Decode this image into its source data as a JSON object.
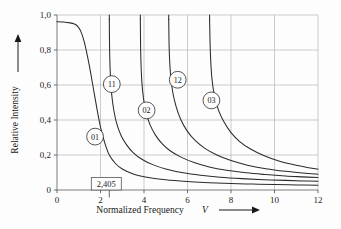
{
  "chart_data": {
    "type": "line",
    "title": "",
    "xlabel": "Normalized Frequency",
    "xlabel_symbol": "V",
    "ylabel": "Relative Intensity",
    "xlim": [
      0,
      12
    ],
    "ylim": [
      0,
      1.0
    ],
    "grid": true,
    "legend": "inline-bubbles",
    "x_ticks": [
      "0",
      "2",
      "4",
      "6",
      "8",
      "10",
      "12"
    ],
    "x_tick_values": [
      0,
      2,
      4,
      6,
      8,
      10,
      12
    ],
    "y_ticks": [
      "0",
      "0,2",
      "0,4",
      "0,6",
      "0,8",
      "1,0"
    ],
    "y_tick_values": [
      0,
      0.2,
      0.4,
      0.6,
      0.8,
      1.0
    ],
    "annotations": [
      {
        "name": "cutoff-2405",
        "text": "2,405",
        "x": 2.405,
        "y": 0.1
      }
    ],
    "series": [
      {
        "name": "01",
        "label": "01",
        "cutoff": 0.0,
        "label_point": {
          "x": 1.75,
          "y": 0.305
        },
        "points": [
          [
            0.0,
            0.962
          ],
          [
            0.3,
            0.96
          ],
          [
            0.6,
            0.955
          ],
          [
            0.8,
            0.948
          ],
          [
            0.95,
            0.935
          ],
          [
            1.1,
            0.905
          ],
          [
            1.25,
            0.848
          ],
          [
            1.4,
            0.765
          ],
          [
            1.55,
            0.668
          ],
          [
            1.7,
            0.56
          ],
          [
            1.85,
            0.455
          ],
          [
            2.0,
            0.36
          ],
          [
            2.2,
            0.268
          ],
          [
            2.405,
            0.2
          ],
          [
            2.7,
            0.15
          ],
          [
            3.0,
            0.12
          ],
          [
            3.5,
            0.092
          ],
          [
            4.0,
            0.076
          ],
          [
            5.0,
            0.058
          ],
          [
            6.0,
            0.048
          ],
          [
            7.0,
            0.042
          ],
          [
            8.0,
            0.037
          ],
          [
            9.0,
            0.034
          ],
          [
            10.0,
            0.031
          ],
          [
            11.0,
            0.029
          ],
          [
            12.0,
            0.027
          ]
        ]
      },
      {
        "name": "11",
        "label": "11",
        "cutoff": 2.405,
        "label_point": {
          "x": 2.52,
          "y": 0.605
        },
        "points": [
          [
            2.405,
            0.975
          ],
          [
            2.42,
            0.79
          ],
          [
            2.46,
            0.64
          ],
          [
            2.52,
            0.54
          ],
          [
            2.62,
            0.45
          ],
          [
            2.75,
            0.378
          ],
          [
            2.95,
            0.31
          ],
          [
            3.2,
            0.258
          ],
          [
            3.5,
            0.214
          ],
          [
            3.9,
            0.176
          ],
          [
            4.4,
            0.145
          ],
          [
            5.0,
            0.12
          ],
          [
            5.8,
            0.098
          ],
          [
            6.6,
            0.084
          ],
          [
            7.5,
            0.073
          ],
          [
            8.5,
            0.065
          ],
          [
            9.5,
            0.059
          ],
          [
            10.5,
            0.055
          ],
          [
            11.3,
            0.052
          ],
          [
            12.0,
            0.05
          ]
        ]
      },
      {
        "name": "02",
        "label": "02",
        "cutoff": 3.832,
        "label_point": {
          "x": 4.12,
          "y": 0.455
        },
        "points": [
          [
            3.832,
            0.975
          ],
          [
            3.85,
            0.78
          ],
          [
            3.9,
            0.62
          ],
          [
            3.98,
            0.52
          ],
          [
            4.1,
            0.44
          ],
          [
            4.28,
            0.372
          ],
          [
            4.52,
            0.315
          ],
          [
            4.82,
            0.266
          ],
          [
            5.2,
            0.224
          ],
          [
            5.7,
            0.188
          ],
          [
            6.3,
            0.157
          ],
          [
            7.0,
            0.132
          ],
          [
            7.8,
            0.113
          ],
          [
            8.7,
            0.098
          ],
          [
            9.6,
            0.088
          ],
          [
            10.5,
            0.08
          ],
          [
            11.3,
            0.075
          ],
          [
            12.0,
            0.071
          ]
        ]
      },
      {
        "name": "12",
        "label": "12",
        "cutoff": 5.136,
        "label_point": {
          "x": 5.55,
          "y": 0.63
        },
        "points": [
          [
            5.136,
            0.975
          ],
          [
            5.16,
            0.8
          ],
          [
            5.22,
            0.66
          ],
          [
            5.32,
            0.56
          ],
          [
            5.48,
            0.475
          ],
          [
            5.7,
            0.4
          ],
          [
            5.98,
            0.338
          ],
          [
            6.35,
            0.283
          ],
          [
            6.8,
            0.238
          ],
          [
            7.35,
            0.2
          ],
          [
            8.0,
            0.168
          ],
          [
            8.75,
            0.142
          ],
          [
            9.6,
            0.122
          ],
          [
            10.5,
            0.107
          ],
          [
            11.3,
            0.097
          ],
          [
            12.0,
            0.09
          ]
        ]
      },
      {
        "name": "03",
        "label": "03",
        "cutoff": 7.016,
        "label_point": {
          "x": 7.1,
          "y": 0.512
        },
        "points": [
          [
            7.016,
            0.975
          ],
          [
            7.05,
            0.79
          ],
          [
            7.12,
            0.64
          ],
          [
            7.24,
            0.54
          ],
          [
            7.42,
            0.458
          ],
          [
            7.68,
            0.388
          ],
          [
            8.0,
            0.328
          ],
          [
            8.4,
            0.277
          ],
          [
            8.9,
            0.234
          ],
          [
            9.5,
            0.197
          ],
          [
            10.2,
            0.166
          ],
          [
            11.0,
            0.141
          ],
          [
            11.5,
            0.129
          ],
          [
            12.0,
            0.119
          ]
        ]
      }
    ]
  },
  "colors": {
    "background": "#fdfdfd",
    "grid": "#b4b4b4",
    "axis": "#6d6d6d",
    "curve": "#2b2b2b",
    "text": "#1a1a1a"
  }
}
